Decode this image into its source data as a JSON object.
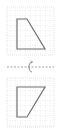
{
  "diagram": {
    "title": "",
    "colors": {
      "grid": "#d6d6d6",
      "shape_stroke": "#6e6e6e",
      "axis": "#8a8a8a",
      "background": "#ffffff"
    },
    "top_panel": {
      "grid": {
        "x": 7,
        "y": 7,
        "width": 47,
        "height": 48,
        "step": 5
      },
      "shape_points": "17,19 27,19 45,49 17,49"
    },
    "mirror_line": {
      "y": 67,
      "x1": 7,
      "x2": 54,
      "icon": "flip-arrow-icon"
    },
    "bottom_panel": {
      "grid": {
        "x": 7,
        "y": 78,
        "width": 47,
        "height": 49,
        "step": 5
      },
      "shape_points": "17,87 45,87 27,117 17,117"
    }
  }
}
